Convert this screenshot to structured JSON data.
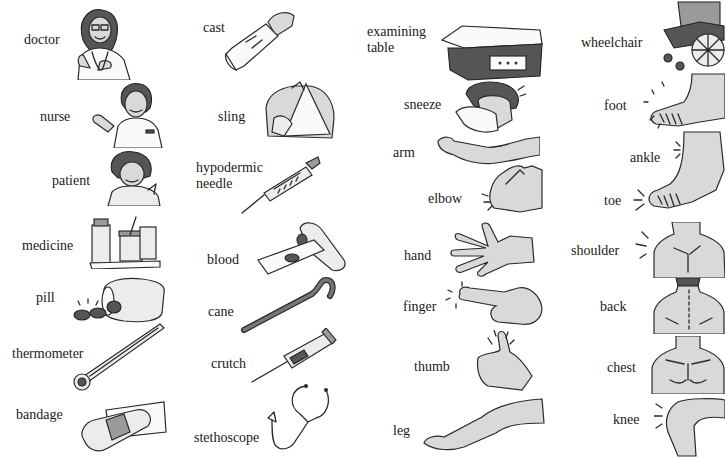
{
  "page": {
    "columns": [
      {
        "items": [
          {
            "label": "doctor",
            "icon": "doctor-illustration"
          },
          {
            "label": "nurse",
            "icon": "nurse-illustration"
          },
          {
            "label": "patient",
            "icon": "patient-illustration"
          },
          {
            "label": "medicine",
            "icon": "medicine-illustration"
          },
          {
            "label": "pill",
            "icon": "pill-illustration"
          },
          {
            "label": "thermometer",
            "icon": "thermometer-illustration"
          },
          {
            "label": "bandage",
            "icon": "bandage-illustration"
          }
        ]
      },
      {
        "items": [
          {
            "label": "cast",
            "icon": "cast-illustration"
          },
          {
            "label": "sling",
            "icon": "sling-illustration"
          },
          {
            "label": "hypodermic\nneedle",
            "icon": "syringe-illustration"
          },
          {
            "label": "blood",
            "icon": "blood-slide-illustration"
          },
          {
            "label": "cane",
            "icon": "cane-illustration"
          },
          {
            "label": "crutch",
            "icon": "crutch-illustration"
          },
          {
            "label": "stethoscope",
            "icon": "stethoscope-illustration"
          }
        ]
      },
      {
        "items": [
          {
            "label": "examining\ntable",
            "icon": "examining-table-illustration"
          },
          {
            "label": "sneeze",
            "icon": "sneeze-illustration"
          },
          {
            "label": "arm",
            "icon": "arm-illustration"
          },
          {
            "label": "elbow",
            "icon": "elbow-illustration"
          },
          {
            "label": "hand",
            "icon": "hand-illustration"
          },
          {
            "label": "finger",
            "icon": "finger-illustration"
          },
          {
            "label": "thumb",
            "icon": "thumb-illustration"
          },
          {
            "label": "leg",
            "icon": "leg-illustration"
          }
        ]
      },
      {
        "items": [
          {
            "label": "wheelchair",
            "icon": "wheelchair-illustration"
          },
          {
            "label": "foot",
            "icon": "foot-illustration"
          },
          {
            "label": "ankle",
            "icon": "ankle-illustration"
          },
          {
            "label": "toe",
            "icon": "toe-illustration"
          },
          {
            "label": "shoulder",
            "icon": "shoulder-illustration"
          },
          {
            "label": "back",
            "icon": "back-illustration"
          },
          {
            "label": "chest",
            "icon": "chest-illustration"
          },
          {
            "label": "knee",
            "icon": "knee-illustration"
          }
        ]
      }
    ]
  }
}
